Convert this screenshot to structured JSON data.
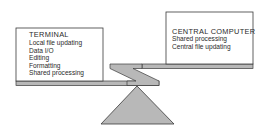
{
  "diagram": {
    "type": "balance-scale",
    "left_pan": {
      "title": "TERMINAL",
      "items": [
        "Local file updating",
        "Data I/O",
        "Editing",
        "Formatting",
        "Shared processing"
      ]
    },
    "right_pan": {
      "title": "CENTRAL COMPUTER",
      "items": [
        "Shared processing",
        "Central file updating"
      ]
    },
    "colors": {
      "outline": "#3a3a3a",
      "fill": "#b8b8b8",
      "box_fill": "#ffffff",
      "text": "#2a2a2a"
    }
  }
}
